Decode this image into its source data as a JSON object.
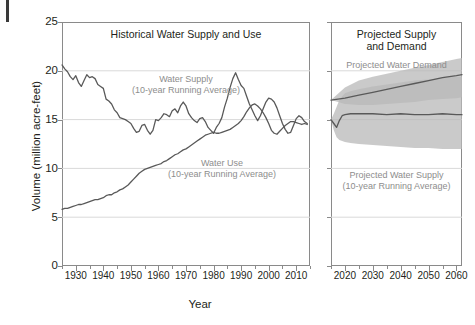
{
  "figure": {
    "y_axis_title": "Volume (million acre-feet)",
    "x_axis_title": "Year"
  },
  "left_panel": {
    "title": "Historical Water Supply and Use",
    "annotation_supply_line1": "Water Supply",
    "annotation_supply_line2": "(10-year Running Average)",
    "annotation_use_line1": "Water Use",
    "annotation_use_line2": "(10-year Running Average)"
  },
  "right_panel": {
    "title_line1": "Projected Supply",
    "title_line2": "and Demand",
    "annotation_demand": "Projected Water Demand",
    "annotation_supply_line1": "Projected Water Supply",
    "annotation_supply_line2": "(10-year Running Average)"
  },
  "colors": {
    "line": "#595959",
    "band": "#b8b8b8",
    "band_overlap": "#9a9a9a",
    "grid": "#d9d9d9",
    "frame": "#8a8a8a",
    "text": "#231f20",
    "annotation": "#8d8d8d"
  },
  "chart_data": {
    "type": "line",
    "xlabel": "Year",
    "ylabel": "Volume (million acre-feet)",
    "ylim": [
      0,
      25
    ],
    "yticks": [
      0,
      5,
      10,
      15,
      20,
      25
    ],
    "grid": true,
    "legend": "inline-annotations",
    "panels": [
      {
        "name": "Historical Water Supply and Use",
        "xlim": [
          1925,
          2015
        ],
        "xticks": [
          1930,
          1940,
          1950,
          1960,
          1970,
          1980,
          1990,
          2000,
          2010
        ],
        "series": [
          {
            "name": "Water Supply (10-year Running Average)",
            "x": [
              1925,
              1926,
              1927,
              1928,
              1929,
              1930,
              1931,
              1932,
              1933,
              1934,
              1935,
              1936,
              1937,
              1938,
              1939,
              1940,
              1941,
              1942,
              1943,
              1944,
              1945,
              1946,
              1947,
              1948,
              1949,
              1950,
              1951,
              1952,
              1953,
              1954,
              1955,
              1956,
              1957,
              1958,
              1959,
              1960,
              1961,
              1962,
              1963,
              1964,
              1965,
              1966,
              1967,
              1968,
              1969,
              1970,
              1971,
              1972,
              1973,
              1974,
              1975,
              1976,
              1977,
              1978,
              1979,
              1980,
              1981,
              1982,
              1983,
              1984,
              1985,
              1986,
              1987,
              1988,
              1989,
              1990,
              1991,
              1992,
              1993,
              1994,
              1995,
              1996,
              1997,
              1998,
              1999,
              2000,
              2001,
              2002,
              2003,
              2004,
              2005,
              2006,
              2007,
              2008,
              2009,
              2010,
              2011,
              2012,
              2013,
              2014
            ],
            "y": [
              20.6,
              20.2,
              19.9,
              19.4,
              19.1,
              19.5,
              18.8,
              18.4,
              19.0,
              19.6,
              19.3,
              19.4,
              19.2,
              18.6,
              18.4,
              18.2,
              17.1,
              16.9,
              16.6,
              16.0,
              15.7,
              15.2,
              15.1,
              15.0,
              14.8,
              14.6,
              14.1,
              13.7,
              13.8,
              14.4,
              14.5,
              13.9,
              13.5,
              13.9,
              15.0,
              14.9,
              15.2,
              15.6,
              15.5,
              15.3,
              15.9,
              16.1,
              15.7,
              16.4,
              16.8,
              16.4,
              15.6,
              15.2,
              14.9,
              14.7,
              15.1,
              15.2,
              14.8,
              14.2,
              13.9,
              13.6,
              14.2,
              14.6,
              15.2,
              16.3,
              17.2,
              18.3,
              19.2,
              19.8,
              19.1,
              18.5,
              18.2,
              17.4,
              16.6,
              16.0,
              15.4,
              14.9,
              15.4,
              16.1,
              16.8,
              17.2,
              17.1,
              16.8,
              16.2,
              15.4,
              14.6,
              14.0,
              13.6,
              13.7,
              14.4,
              15.1,
              15.4,
              15.2,
              14.8,
              14.6
            ]
          },
          {
            "name": "Water Use (10-year Running Average)",
            "x": [
              1925,
              1926,
              1927,
              1928,
              1929,
              1930,
              1931,
              1932,
              1933,
              1934,
              1935,
              1936,
              1937,
              1938,
              1939,
              1940,
              1941,
              1942,
              1943,
              1944,
              1945,
              1946,
              1947,
              1948,
              1949,
              1950,
              1951,
              1952,
              1953,
              1954,
              1955,
              1956,
              1957,
              1958,
              1959,
              1960,
              1961,
              1962,
              1963,
              1964,
              1965,
              1966,
              1967,
              1968,
              1969,
              1970,
              1971,
              1972,
              1973,
              1974,
              1975,
              1976,
              1977,
              1978,
              1979,
              1980,
              1981,
              1982,
              1983,
              1984,
              1985,
              1986,
              1987,
              1988,
              1989,
              1990,
              1991,
              1992,
              1993,
              1994,
              1995,
              1996,
              1997,
              1998,
              1999,
              2000,
              2001,
              2002,
              2003,
              2004,
              2005,
              2006,
              2007,
              2008,
              2009,
              2010,
              2011,
              2012,
              2013,
              2014
            ],
            "y": [
              5.8,
              5.9,
              5.9,
              6.0,
              6.1,
              6.2,
              6.3,
              6.3,
              6.4,
              6.5,
              6.6,
              6.7,
              6.8,
              6.8,
              6.9,
              7.0,
              7.2,
              7.3,
              7.3,
              7.5,
              7.6,
              7.8,
              7.9,
              8.1,
              8.3,
              8.6,
              8.9,
              9.2,
              9.5,
              9.7,
              9.9,
              10.0,
              10.1,
              10.2,
              10.3,
              10.4,
              10.5,
              10.7,
              10.8,
              11.0,
              11.2,
              11.4,
              11.5,
              11.7,
              11.9,
              12.0,
              12.2,
              12.4,
              12.6,
              12.8,
              13.0,
              13.2,
              13.4,
              13.5,
              13.6,
              13.7,
              13.6,
              13.6,
              13.7,
              13.8,
              13.9,
              14.0,
              14.2,
              14.4,
              14.6,
              14.9,
              15.3,
              15.8,
              16.2,
              16.5,
              16.6,
              16.4,
              16.1,
              15.7,
              15.2,
              14.6,
              13.9,
              13.6,
              13.5,
              13.8,
              14.1,
              14.4,
              14.6,
              14.8,
              14.8,
              14.7,
              14.6,
              14.5,
              14.6,
              14.5
            ]
          }
        ]
      },
      {
        "name": "Projected Supply and Demand",
        "xlim": [
          2015,
          2062
        ],
        "xticks": [
          2020,
          2030,
          2040,
          2050,
          2060
        ],
        "series": [
          {
            "name": "Projected Water Demand",
            "x": [
              2015,
              2020,
              2025,
              2030,
              2035,
              2040,
              2045,
              2050,
              2055,
              2060,
              2062
            ],
            "y": [
              17.0,
              17.2,
              17.5,
              17.8,
              18.1,
              18.4,
              18.7,
              19.0,
              19.3,
              19.5,
              19.6
            ],
            "band_low": [
              17.0,
              16.6,
              16.5,
              16.5,
              16.6,
              16.7,
              16.8,
              17.0,
              17.1,
              17.2,
              17.3
            ],
            "band_high": [
              17.0,
              18.3,
              19.0,
              19.4,
              19.7,
              20.0,
              20.3,
              20.6,
              20.9,
              21.2,
              21.3
            ]
          },
          {
            "name": "Projected Water Supply (10-year Running Average)",
            "x": [
              2015,
              2016,
              2017,
              2018,
              2019,
              2020,
              2022,
              2025,
              2030,
              2035,
              2040,
              2045,
              2050,
              2055,
              2060,
              2062
            ],
            "y": [
              15.0,
              14.6,
              14.2,
              14.9,
              15.4,
              15.5,
              15.6,
              15.6,
              15.6,
              15.5,
              15.6,
              15.5,
              15.5,
              15.6,
              15.5,
              15.5
            ],
            "band_low": [
              15.0,
              13.9,
              13.2,
              12.9,
              12.8,
              12.7,
              12.6,
              12.5,
              12.4,
              12.3,
              12.2,
              12.1,
              12.1,
              12.0,
              12.0,
              12.0
            ],
            "band_high": [
              15.0,
              15.6,
              16.3,
              17.0,
              17.4,
              17.7,
              17.9,
              18.1,
              18.4,
              18.6,
              18.8,
              19.0,
              19.1,
              19.3,
              19.4,
              19.4
            ]
          }
        ]
      }
    ]
  }
}
